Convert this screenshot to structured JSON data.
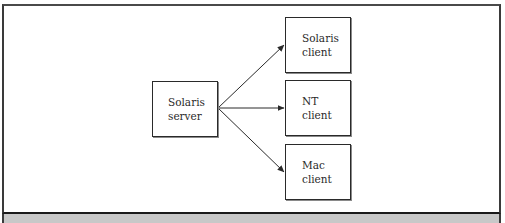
{
  "diagram": {
    "type": "client-server",
    "server": {
      "id": "solaris-server",
      "lines": [
        "Solaris",
        "server"
      ]
    },
    "clients": [
      {
        "id": "solaris-client",
        "lines": [
          "Solaris",
          "client"
        ]
      },
      {
        "id": "nt-client",
        "lines": [
          "NT",
          "client"
        ]
      },
      {
        "id": "mac-client",
        "lines": [
          "Mac",
          "client"
        ]
      }
    ],
    "edges": [
      {
        "from": "solaris-server",
        "to": "solaris-client"
      },
      {
        "from": "solaris-server",
        "to": "nt-client"
      },
      {
        "from": "solaris-server",
        "to": "mac-client"
      }
    ]
  },
  "colors": {
    "stroke": "#2a2a2a",
    "caption_band": "#c8c8c8",
    "background": "#ffffff"
  }
}
